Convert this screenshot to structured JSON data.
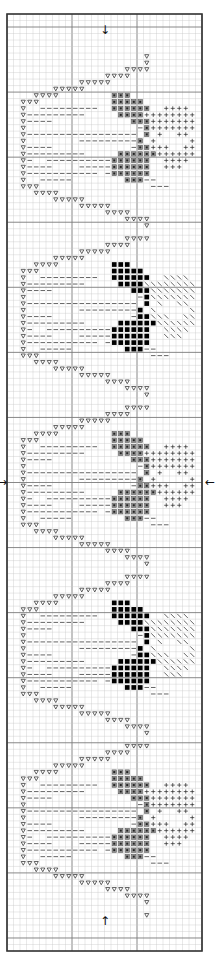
{
  "pattern": {
    "title": "Cross-stitch heart border chart",
    "frame": {
      "left": 7,
      "top": 14,
      "width": 195,
      "height": 937
    },
    "columns": 30,
    "rows": 144,
    "major_every": 10,
    "colors": {
      "background": "#ffffff",
      "minor_grid": "#c8c8c8",
      "major_grid": "#7a7a7a",
      "border": "#333333",
      "symbol": "#222222",
      "gray_square": "#555555",
      "black_square": "#000000"
    },
    "center_arrows": {
      "top": "↓",
      "bottom": "↑",
      "left": "→",
      "right": "←"
    },
    "legend_symbols": {
      "T": "triangle-outline (outline stitch)",
      "D": "dash (backstitch fill)",
      "G": "gray square (heart, light)",
      "B": "black square (heart, dark)",
      "P": "plus (light accent)",
      "H": "diagonal hatch (dark accent)"
    },
    "heart_period_rows": 26,
    "first_heart_start_row": 8,
    "lead_in_rows": [
      {
        "row": 6,
        "T": [
          21
        ]
      },
      {
        "row": 7,
        "T": [
          21
        ]
      }
    ],
    "heart_styles": [
      "light",
      "dark",
      "light",
      "dark",
      "light"
    ],
    "heart_template": [
      {
        "T": [
          [
            18,
            21
          ]
        ]
      },
      {
        "T": [
          [
            15,
            18
          ]
        ]
      },
      {
        "T": [
          [
            11,
            15
          ]
        ]
      },
      {
        "T": [
          [
            7,
            11
          ]
        ]
      },
      {
        "T": [
          [
            4,
            7
          ]
        ],
        "S": [
          [
            16,
            18
          ]
        ]
      },
      {
        "T": [
          [
            2,
            4
          ]
        ],
        "S": [
          [
            16,
            20
          ]
        ]
      },
      {
        "T": [
          [
            2,
            2
          ]
        ],
        "D": [
          [
            5,
            13
          ]
        ],
        "S": [
          [
            16,
            21
          ]
        ],
        "A": [
          [
            24,
            27
          ]
        ]
      },
      {
        "T": [
          [
            2,
            2
          ]
        ],
        "D": [
          [
            3,
            11
          ]
        ],
        "S": [
          [
            17,
            20
          ]
        ],
        "A": [
          [
            21,
            28
          ]
        ]
      },
      {
        "T": [
          [
            2,
            2
          ]
        ],
        "D": [
          [
            3,
            6
          ]
        ],
        "S": [
          [
            19,
            21
          ]
        ],
        "A": [
          [
            22,
            28
          ]
        ]
      },
      {
        "T": [
          [
            2,
            2
          ]
        ],
        "D": [
          [
            20,
            20
          ]
        ],
        "S": [
          [
            21,
            21
          ]
        ],
        "A": [
          [
            22,
            28
          ]
        ]
      },
      {
        "T": [
          [
            2,
            2
          ]
        ],
        "D": [
          [
            3,
            19
          ]
        ],
        "S": [
          [
            21,
            21
          ]
        ],
        "A": [
          [
            23,
            23
          ],
          [
            26,
            27
          ]
        ]
      },
      {
        "T": [
          [
            2,
            2
          ]
        ],
        "D": [
          [
            11,
            19
          ]
        ],
        "S": [
          [
            20,
            20
          ]
        ],
        "A": [
          [
            22,
            22
          ],
          [
            28,
            28
          ]
        ]
      },
      {
        "T": [
          [
            2,
            2
          ]
        ],
        "D": [
          [
            3,
            6
          ],
          [
            19,
            19
          ]
        ],
        "S": [
          [
            20,
            21
          ]
        ],
        "A": [
          [
            22,
            24
          ],
          [
            27,
            28
          ]
        ]
      },
      {
        "T": [
          [
            2,
            2
          ]
        ],
        "D": [
          [
            3,
            11
          ]
        ],
        "S": [
          [
            17,
            22
          ]
        ],
        "A": [
          [
            23,
            28
          ]
        ]
      },
      {
        "T": [
          [
            2,
            2
          ]
        ],
        "D": [
          [
            3,
            3
          ],
          [
            6,
            15
          ]
        ],
        "S": [
          [
            16,
            21
          ]
        ],
        "A": [
          [
            24,
            27
          ]
        ]
      },
      {
        "T": [
          [
            2,
            2
          ]
        ],
        "D": [
          [
            3,
            6
          ],
          [
            11,
            15
          ]
        ],
        "S": [
          [
            16,
            21
          ]
        ],
        "A": [
          [
            24,
            26
          ]
        ]
      },
      {
        "T": [
          [
            2,
            2
          ]
        ],
        "D": [
          [
            3,
            13
          ],
          [
            15,
            15
          ]
        ],
        "S": [
          [
            16,
            21
          ]
        ]
      },
      {
        "T": [
          [
            2,
            2
          ]
        ],
        "D": [
          [
            5,
            9
          ],
          [
            21,
            22
          ]
        ],
        "S": [
          [
            18,
            20
          ]
        ]
      },
      {
        "T": [
          [
            2,
            4
          ]
        ],
        "D": [
          [
            22,
            24
          ]
        ]
      },
      {
        "T": [
          [
            4,
            7
          ]
        ]
      },
      {
        "T": [
          [
            7,
            11
          ]
        ]
      },
      {
        "T": [
          [
            11,
            15
          ]
        ]
      },
      {
        "T": [
          [
            15,
            18
          ]
        ]
      },
      {
        "T": [
          [
            18,
            21
          ]
        ]
      },
      {
        "T": [
          [
            21,
            21
          ]
        ]
      }
    ],
    "tail_rows": [
      {
        "row": 138,
        "T": [
          21
        ]
      }
    ]
  }
}
